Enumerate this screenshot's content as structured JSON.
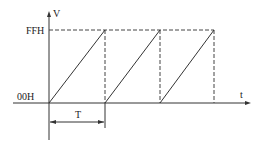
{
  "diagram": {
    "title": "",
    "y_axis_label": "V",
    "x_axis_label": "t",
    "level_high": "FFH",
    "level_low": "00H",
    "period_label": "T",
    "waveform": "sawtooth",
    "periods_shown": 3,
    "colors": {
      "line": "#333333",
      "background": "#ffffff"
    }
  }
}
